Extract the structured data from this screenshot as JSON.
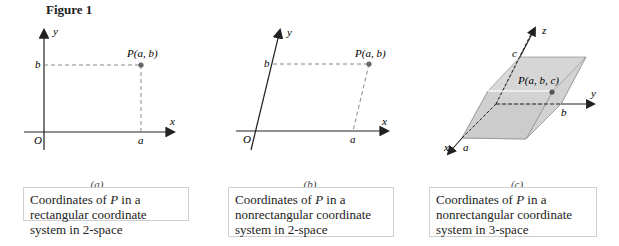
{
  "figure_title": "Figure 1",
  "panels": [
    {
      "id": "a",
      "sublabel": "(a)",
      "caption_parts": [
        "Coordinates of ",
        "P",
        " in a rectangular coordinate system in 2-space"
      ],
      "labels": {
        "x": "x",
        "y": "y",
        "origin": "O",
        "a": "a",
        "b": "b",
        "point": "P(a, b)"
      }
    },
    {
      "id": "b",
      "sublabel": "(b)",
      "caption_parts": [
        "Coordinates of ",
        "P",
        " in a nonrectangular coordinate system in 2-space"
      ],
      "labels": {
        "x": "x",
        "y": "y",
        "origin": "O",
        "a": "a",
        "b": "b",
        "point": "P(a, b)"
      }
    },
    {
      "id": "c",
      "sublabel": "(c)",
      "caption_parts": [
        "Coordinates of ",
        "P",
        " in a nonrectangular coordinate system in 3-space"
      ],
      "labels": {
        "x": "x",
        "y": "y",
        "z": "z",
        "a": "a",
        "b": "b",
        "c": "c",
        "point": "P(a, b, c)"
      }
    }
  ],
  "colors": {
    "axis": "#222222",
    "dashed": "#888888",
    "point": "#666666",
    "shade": "#d9d9d9",
    "shade_edge": "#9a9a9a"
  }
}
